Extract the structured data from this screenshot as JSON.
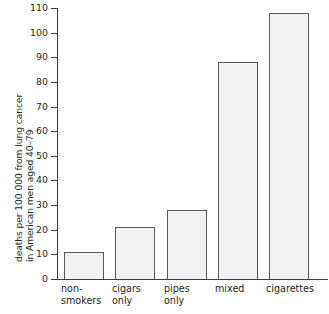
{
  "chart_data": {
    "type": "bar",
    "title": "",
    "subtitle": "",
    "xlabel": "",
    "ylabel": "deaths per 100 000 from lung cancer in American men aged 40–79",
    "ylabel_lines": [
      "deaths per 100 000 from lung cancer",
      "in American men aged 40–79"
    ],
    "categories": [
      "non-smokers",
      "cigars only",
      "pipes only",
      "mixed",
      "cigarettes"
    ],
    "category_label_lines": [
      [
        "non-",
        "smokers"
      ],
      [
        "cigars",
        "only"
      ],
      [
        "pipes",
        "only"
      ],
      [
        "mixed"
      ],
      [
        "cigarettes"
      ]
    ],
    "values": [
      11,
      21,
      28,
      88,
      108
    ],
    "ylim": [
      0,
      110
    ],
    "ytick_step": 10,
    "ytick_labels": [
      "0",
      "10",
      "20",
      "30",
      "40",
      "50",
      "60",
      "70",
      "80",
      "90",
      "100",
      "110"
    ],
    "ytick_values": [
      0,
      10,
      20,
      30,
      40,
      50,
      60,
      70,
      80,
      90,
      100,
      110
    ],
    "grid": false,
    "legend": false,
    "legend_position": "none",
    "bar_fill_color": "#f2f2f2",
    "bar_border_color": "#595959",
    "axis_color": "#3d3d3d",
    "text_color": "#231f20",
    "background_color": "#ffffff"
  }
}
